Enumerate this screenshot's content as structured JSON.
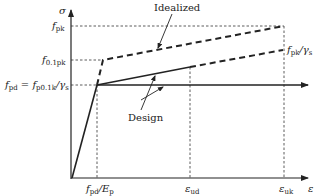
{
  "diagram": {
    "type": "stress-strain diagram",
    "axes": {
      "y_label": "σ",
      "x_label": "ε"
    },
    "y_ticks": [
      {
        "main": "f",
        "sub": "pk"
      },
      {
        "main": "f",
        "sub": "0.1pk"
      },
      {
        "main": "f",
        "sub": "pd",
        "rest": " = f",
        "sub2": "p0.1k",
        "tail": "/γ",
        "sub3": "s"
      }
    ],
    "x_ticks": [
      {
        "main": "f",
        "sub": "pd",
        "tail": "/E",
        "sub2": "p"
      },
      {
        "main": "ε",
        "sub": "ud"
      },
      {
        "main": "ε",
        "sub": "uk"
      }
    ],
    "right_label": {
      "main": "f",
      "sub": "pk",
      "tail": "/γ",
      "sub2": "s"
    },
    "curves": [
      {
        "name": "Idealized",
        "style": "dashed",
        "label": "Idealized"
      },
      {
        "name": "Design",
        "style": "solid",
        "label": "Design"
      }
    ],
    "colors": {
      "line": "#222222",
      "background": "#ffffff"
    }
  }
}
